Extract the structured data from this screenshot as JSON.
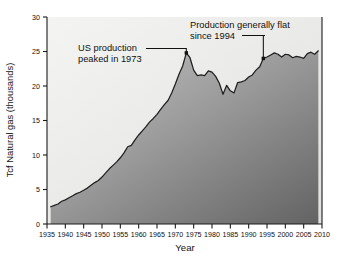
{
  "chart_data": {
    "type": "area",
    "title": "",
    "xlabel": "Year",
    "ylabel": "Tcf Natural gas (thousands)",
    "xlim": [
      1935,
      2010
    ],
    "ylim": [
      0,
      30
    ],
    "grid": false,
    "legend": "none",
    "xticks": [
      1935,
      1940,
      1945,
      1950,
      1955,
      1960,
      1965,
      1970,
      1975,
      1980,
      1985,
      1990,
      1995,
      2000,
      2005,
      2010
    ],
    "xtick_labels": [
      "1935",
      "1940",
      "1945",
      "1950",
      "1955",
      "1960",
      "1965",
      "1970",
      "1975",
      "1980",
      "1985",
      "1990",
      "1995",
      "2000",
      "2005",
      "2010"
    ],
    "yticks": [
      0,
      5,
      10,
      15,
      20,
      25,
      30
    ],
    "ytick_labels": [
      "0",
      "5",
      "10",
      "15",
      "20",
      "25",
      "30"
    ],
    "series_name": "US natural gas production",
    "x": [
      1936,
      1937,
      1938,
      1939,
      1940,
      1941,
      1942,
      1943,
      1944,
      1945,
      1946,
      1947,
      1948,
      1949,
      1950,
      1951,
      1952,
      1953,
      1954,
      1955,
      1956,
      1957,
      1958,
      1959,
      1960,
      1961,
      1962,
      1963,
      1964,
      1965,
      1966,
      1967,
      1968,
      1969,
      1970,
      1971,
      1972,
      1973,
      1974,
      1975,
      1976,
      1977,
      1978,
      1979,
      1980,
      1981,
      1982,
      1983,
      1984,
      1985,
      1986,
      1987,
      1988,
      1989,
      1990,
      1991,
      1992,
      1993,
      1994,
      1995,
      1996,
      1997,
      1998,
      1999,
      2000,
      2001,
      2002,
      2003,
      2004,
      2005,
      2006,
      2007,
      2008,
      2009
    ],
    "values": [
      2.5,
      2.7,
      2.9,
      3.3,
      3.5,
      3.8,
      4.1,
      4.4,
      4.6,
      4.9,
      5.2,
      5.6,
      6.0,
      6.3,
      6.8,
      7.4,
      8.0,
      8.5,
      9.0,
      9.6,
      10.3,
      11.2,
      11.4,
      12.2,
      12.9,
      13.5,
      14.1,
      14.8,
      15.3,
      15.9,
      16.6,
      17.3,
      17.9,
      19.0,
      20.3,
      21.7,
      22.9,
      24.8,
      24.1,
      22.3,
      21.5,
      21.6,
      21.5,
      22.2,
      22.0,
      21.4,
      20.4,
      18.8,
      20.1,
      19.3,
      19.0,
      20.5,
      20.6,
      20.8,
      21.3,
      21.6,
      22.3,
      22.8,
      24.0,
      24.2,
      24.5,
      24.8,
      24.6,
      24.2,
      24.6,
      24.5,
      24.1,
      24.3,
      24.2,
      24.0,
      24.7,
      24.9,
      24.6,
      25.1
    ],
    "annotations": [
      {
        "id": "peak-1973",
        "text_line1": "US production",
        "text_line2": "peaked in 1973",
        "point_x": 1973,
        "point_y": 24.8
      },
      {
        "id": "flat-since-1994",
        "text_line1": "Production generally flat",
        "text_line2": "since 1994",
        "point_x": 1994,
        "point_y": 24.0
      }
    ],
    "colors": {
      "line": "#1f1f1f",
      "fill_light": "#b9b9b9",
      "fill_dark": "#6e6e6e",
      "background_light": "#f2f2f0",
      "background_dark": "#e3e3e1",
      "axis": "#1a1a1a",
      "text": "#111111"
    }
  }
}
